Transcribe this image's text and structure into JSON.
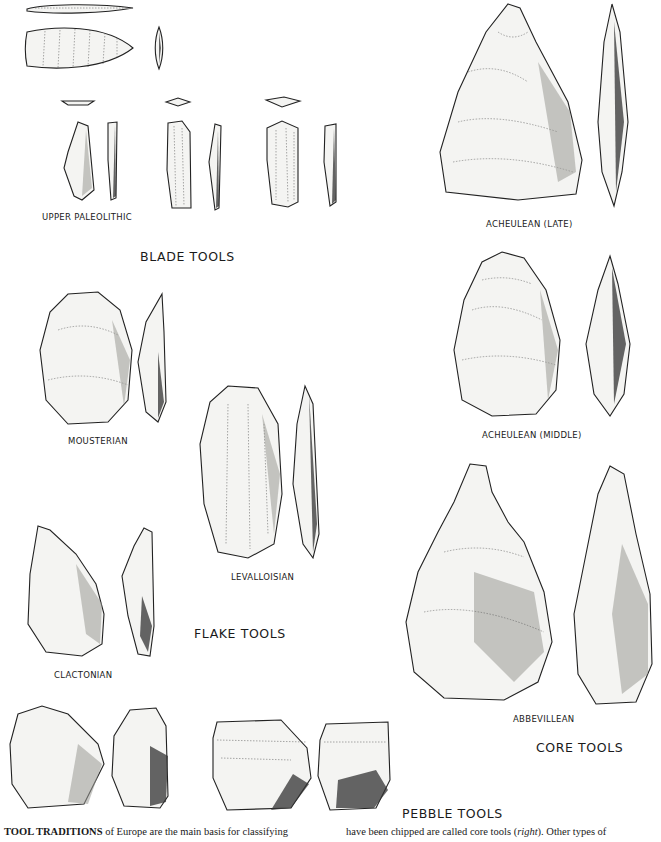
{
  "groups": {
    "blade": {
      "title": "BLADE TOOLS",
      "items": [
        {
          "label": "UPPER PALEOLITHIC"
        }
      ]
    },
    "flake": {
      "title": "FLAKE TOOLS",
      "items": [
        {
          "label": "MOUSTERIAN"
        },
        {
          "label": "LEVALLOISIAN"
        },
        {
          "label": "CLACTONIAN"
        }
      ]
    },
    "core": {
      "title": "CORE TOOLS",
      "items": [
        {
          "label": "ACHEULEAN (LATE)"
        },
        {
          "label": "ACHEULEAN (MIDDLE)"
        },
        {
          "label": "ABBEVILLEAN"
        }
      ]
    },
    "pebble": {
      "title": "PEBBLE TOOLS"
    }
  },
  "caption": {
    "left_bold": "TOOL TRADITIONS",
    "left_text": " of Europe are the main basis for classifying",
    "right_pre": "have been chipped are called core tools (",
    "right_italic": "right",
    "right_post": "). Other types of"
  }
}
